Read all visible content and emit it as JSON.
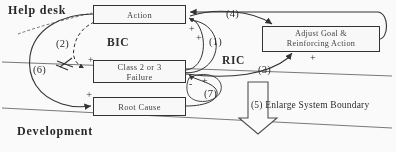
{
  "diagram": {
    "title_zones": [
      {
        "name": "help-desk",
        "label": "Help desk"
      },
      {
        "name": "development",
        "label": "Development"
      }
    ],
    "nodes": [
      {
        "id": "action",
        "label": "Action"
      },
      {
        "id": "failure",
        "label": "Class 2 or 3\nFailure"
      },
      {
        "id": "root_cause",
        "label": "Root Cause"
      },
      {
        "id": "adjust",
        "label": "Adjust Goal &\nReinforcing Action"
      }
    ],
    "loops": [
      {
        "id": "bic",
        "label": "BIC"
      },
      {
        "id": "ric",
        "label": "RIC"
      }
    ],
    "step_labels": {
      "n1": "(1)",
      "n2": "(2)",
      "n3": "(3)",
      "n4": "(4)",
      "n6": "(6)",
      "n7": "(7)"
    },
    "annotations": {
      "enlarge": "(5) Enlarge System Boundary"
    },
    "polarities": {
      "p1": "+",
      "p2": "+",
      "p3": "+",
      "p4": "-",
      "p5": "+",
      "p6": "+",
      "p7": "+"
    },
    "colors": {
      "stroke": "#2b2b2b",
      "text": "#1f1f1f",
      "background": "#ffffff"
    }
  }
}
